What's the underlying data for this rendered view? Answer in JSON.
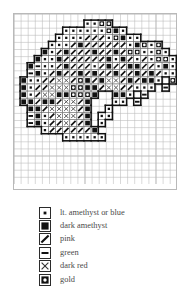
{
  "chart_data": {
    "type": "table",
    "title": "",
    "subtitle": "",
    "xlabel": "",
    "ylabel": "",
    "grid": true,
    "legend_position": "bottom",
    "cols": 23,
    "rows": 24,
    "cell_px": 7.1,
    "symbol_key": {
      "dot": "lt. amethyst or blue",
      "square": "dark amethyst",
      "slash": "pink",
      "dash": "green",
      "cross": "dark red",
      "circle": "gold",
      "empty": ""
    },
    "outline_color": "#111111",
    "grid_color": "#b9b9b9",
    "symbol_color": "#111111",
    "rows_data": [
      "........................",
      "..........ddoo..........",
      ".......ddddddosd........",
      "......dddd///dosdd......",
      ".....ddd/s//////dsodo...",
      "....sd/s///s//s/ooddod..",
      "...sdds//////sds/d/dood.",
      "..s-dd/s///d/s//ss//dsd.",
      "..-sd/s//s/s//s//s/s/dd.",
      ".sdd//xx/os/sxx/s/ssd.o.",
      ".sd//xxx@@ss/xx//ddd.-..",
      ".sd/xxsso@os..ssd.-.....",
      ".ss/ss/xx/s...dd.-......",
      "..ss/xxxx/s..d..........",
      "..-sd/xxx/s.dd..........",
      "..-sd//x//s.d...........",
      "....d//////s............",
      ".......dddddd...........",
      "........................",
      "........................",
      "........................",
      "........................",
      "........................",
      "........................"
    ]
  },
  "chart": {
    "name": "cross-stitch-pattern-chart"
  },
  "legend": {
    "title": "",
    "items": [
      {
        "symbol": "dot",
        "label": "lt. amethyst or blue"
      },
      {
        "symbol": "square",
        "label": "dark amethyst"
      },
      {
        "symbol": "slash",
        "label": "pink"
      },
      {
        "symbol": "dash",
        "label": "green"
      },
      {
        "symbol": "cross",
        "label": "dark red"
      },
      {
        "symbol": "circle",
        "label": "gold"
      }
    ]
  }
}
